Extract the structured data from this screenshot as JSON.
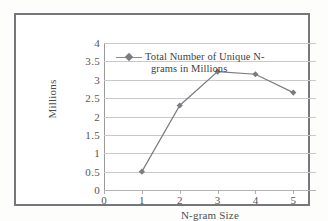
{
  "chart_data": {
    "type": "line",
    "title": "",
    "xlabel": "N-gram Size",
    "ylabel": "Millions",
    "xlim": [
      0,
      5.6
    ],
    "ylim": [
      0,
      4
    ],
    "grid": true,
    "legend_position": "inside-upper-left",
    "x": [
      1,
      2,
      3,
      4,
      5
    ],
    "categories": [
      "1",
      "2",
      "3",
      "4",
      "5"
    ],
    "series": [
      {
        "name": "Total Number of Unique N-grams in Millions",
        "values": [
          0.5,
          2.3,
          3.22,
          3.15,
          2.65
        ],
        "color": "#7b7c81",
        "marker": "diamond"
      }
    ],
    "xticks": [
      "0",
      "1",
      "2",
      "3",
      "4",
      "5"
    ],
    "xtick_values": [
      0,
      1,
      2,
      3,
      4,
      5
    ],
    "yticks": [
      "0",
      "0.5",
      "1",
      "1.5",
      "2",
      "2.5",
      "3",
      "3.5",
      "4"
    ],
    "ytick_values": [
      0,
      0.5,
      1,
      1.5,
      2,
      2.5,
      3,
      3.5,
      4
    ]
  },
  "legend": {
    "line1": "Total Number of Unique N-",
    "line2": "grams in Millions"
  },
  "colors": {
    "series": "#7b7c81",
    "grid": "#c9c9c9",
    "axis": "#9a9a9a",
    "text": "#54555a",
    "frame": "#76777a"
  }
}
